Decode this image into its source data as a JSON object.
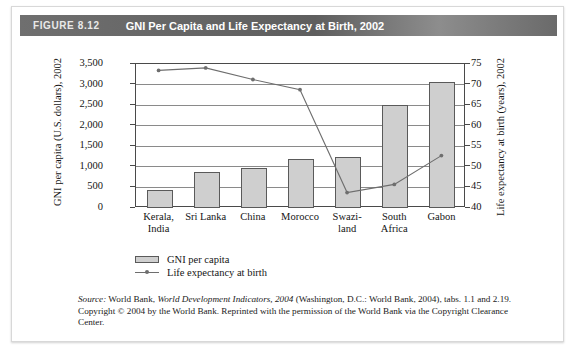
{
  "figure": {
    "number": "FIGURE 8.12",
    "title": "GNI Per Capita and Life Expectancy at Birth, 2002"
  },
  "source_note": {
    "source_word": "Source:",
    "part1": " World Bank, ",
    "italic_title": "World Development Indicators, 2004",
    "part2": " (Washington, D.C.: World Bank, 2004), tabs. 1.1 and 2.19. Copyright © 2004 by the World Bank. Reprinted with the permission of the World Bank via the Copyright Clearance Center."
  },
  "legend": {
    "bar_label": "GNI per capita",
    "line_label": "Life expectancy at birth"
  },
  "chart_data": {
    "type": "bar",
    "title": "GNI Per Capita and Life Expectancy at Birth, 2002",
    "xlabel": "",
    "ylabel": "GNI per capita (U.S. dollars), 2002",
    "y2label": "Life expectancy at birth (years), 2002",
    "categories": [
      "Kerala, India",
      "Sri Lanka",
      "China",
      "Morocco",
      "Swazi-land",
      "South Africa",
      "Gabon"
    ],
    "category_lines": [
      [
        "Kerala,",
        "India"
      ],
      [
        "Sri Lanka",
        ""
      ],
      [
        "China",
        ""
      ],
      [
        "Morocco",
        ""
      ],
      [
        "Swazi-",
        "land"
      ],
      [
        "South",
        "Africa"
      ],
      [
        "Gabon",
        ""
      ]
    ],
    "ylim": [
      0,
      3500
    ],
    "y2lim": [
      40,
      75
    ],
    "yticks": [
      "0",
      "500",
      "1,000",
      "1,500",
      "2,000",
      "2,500",
      "3,000",
      "3,500"
    ],
    "ytick_values": [
      0,
      500,
      1000,
      1500,
      2000,
      2500,
      3000,
      3500
    ],
    "y2ticks": [
      "40",
      "45",
      "50",
      "55",
      "60",
      "65",
      "70",
      "75"
    ],
    "y2tick_values": [
      40,
      45,
      50,
      55,
      60,
      65,
      70,
      75
    ],
    "grid": true,
    "legend_position": "below-left",
    "series": [
      {
        "name": "GNI per capita",
        "type": "bar",
        "axis": "left",
        "unit": "U.S. dollars",
        "values": [
          440,
          870,
          980,
          1180,
          1250,
          2500,
          3060
        ],
        "color": "#cfcfcf"
      },
      {
        "name": "Life expectancy at birth",
        "type": "line",
        "axis": "right",
        "unit": "years",
        "values": [
          73.2,
          73.8,
          71.0,
          68.5,
          43.5,
          45.5,
          52.5
        ],
        "color": "#6e6e6e"
      }
    ]
  }
}
